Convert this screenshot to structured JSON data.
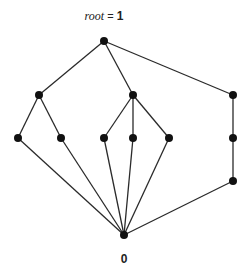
{
  "diagram": {
    "type": "hasse-diagram",
    "top_label": {
      "var": "root",
      "eq": " = ",
      "value": "1"
    },
    "bottom_label": "0",
    "nodes": [
      {
        "id": "top",
        "x": 104,
        "y": 41
      },
      {
        "id": "a",
        "x": 39,
        "y": 95
      },
      {
        "id": "b",
        "x": 133,
        "y": 95
      },
      {
        "id": "c",
        "x": 233,
        "y": 95
      },
      {
        "id": "a1",
        "x": 18,
        "y": 138
      },
      {
        "id": "a2",
        "x": 61,
        "y": 138
      },
      {
        "id": "b1",
        "x": 104,
        "y": 138
      },
      {
        "id": "b2",
        "x": 133,
        "y": 138
      },
      {
        "id": "b3",
        "x": 169,
        "y": 138
      },
      {
        "id": "c1",
        "x": 233,
        "y": 138
      },
      {
        "id": "c2",
        "x": 233,
        "y": 181
      },
      {
        "id": "bottom",
        "x": 124,
        "y": 235
      }
    ],
    "edges": [
      [
        "top",
        "a"
      ],
      [
        "top",
        "b"
      ],
      [
        "top",
        "c"
      ],
      [
        "a",
        "a1"
      ],
      [
        "a",
        "a2"
      ],
      [
        "b",
        "b1"
      ],
      [
        "b",
        "b2"
      ],
      [
        "b",
        "b3"
      ],
      [
        "c",
        "c1"
      ],
      [
        "c1",
        "c2"
      ],
      [
        "a1",
        "bottom"
      ],
      [
        "a2",
        "bottom"
      ],
      [
        "b1",
        "bottom"
      ],
      [
        "b2",
        "bottom"
      ],
      [
        "b3",
        "bottom"
      ],
      [
        "c2",
        "bottom"
      ]
    ],
    "colors": {
      "edge": "#2a2a2a",
      "node": "#111111"
    },
    "node_radius": 4
  }
}
